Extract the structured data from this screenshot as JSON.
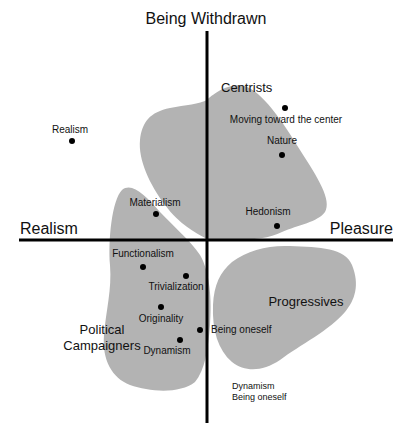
{
  "diagram": {
    "type": "quadrant-map",
    "colors": {
      "background": "#ffffff",
      "blob_fill": "#b3b3b3",
      "axis": "#000000",
      "text": "#111111"
    },
    "axes": {
      "top": "Being Withdrawn",
      "left": "Realism",
      "right": "Pleasure"
    },
    "groups": [
      {
        "name": "Centrists",
        "label": "Centrists"
      },
      {
        "name": "Political Campaigners",
        "label_line1": "Political",
        "label_line2": "Campaigners"
      },
      {
        "name": "Progressives",
        "label": "Progressives"
      }
    ],
    "points": [
      {
        "label": "Realism",
        "x": 72,
        "y": 141
      },
      {
        "label": "Moving toward the center",
        "x": 285,
        "y": 108
      },
      {
        "label": "Nature",
        "x": 282,
        "y": 155
      },
      {
        "label": "Materialism",
        "x": 156,
        "y": 214
      },
      {
        "label": "Hedonism",
        "x": 277,
        "y": 226
      },
      {
        "label": "Functionalism",
        "x": 143,
        "y": 267
      },
      {
        "label": "Trivialization",
        "x": 186,
        "y": 276
      },
      {
        "label": "Originality",
        "x": 161,
        "y": 307
      },
      {
        "label": "Being oneself",
        "x": 200,
        "y": 330
      },
      {
        "label": "Dynamism",
        "x": 180,
        "y": 340
      }
    ],
    "legend_note": {
      "line1": "Dynamism",
      "line2": "Being oneself"
    }
  }
}
